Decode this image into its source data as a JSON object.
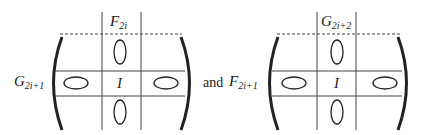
{
  "left_matrix": {
    "row_label": {
      "base": "G",
      "subscript": "2i+1"
    },
    "column_label": {
      "base": "F",
      "subscript": "2i"
    },
    "center_label": "I"
  },
  "connector_text": "and",
  "right_matrix": {
    "row_label": {
      "base": "F",
      "subscript": "2i+1"
    },
    "column_label": {
      "base": "G",
      "subscript": "2i+2"
    },
    "center_label": "I"
  },
  "colors": {
    "stroke": "#333333",
    "text": "#222222",
    "background": "#ffffff"
  }
}
